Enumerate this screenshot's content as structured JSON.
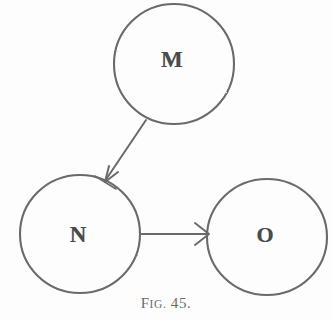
{
  "figure": {
    "caption_full": "FIG. 45.",
    "caption_prefix": "F",
    "caption_prefix_small": "IG.",
    "caption_number": "45.",
    "background_color": "#fdfdfd",
    "stroke_color": "#6a6a6a",
    "label_color": "#4b4b4b"
  },
  "diagram": {
    "type": "node-arrow-diagram",
    "nodes": [
      {
        "id": "M",
        "label": "M",
        "cx": 174,
        "cy": 64,
        "rx": 60,
        "ry": 60,
        "label_x": 172,
        "label_y": 59
      },
      {
        "id": "N",
        "label": "N",
        "cx": 80,
        "cy": 234,
        "rx": 60,
        "ry": 59,
        "label_x": 78,
        "label_y": 234
      },
      {
        "id": "O",
        "label": "O",
        "cx": 267,
        "cy": 237,
        "rx": 60,
        "ry": 58,
        "label_x": 265,
        "label_y": 235
      }
    ],
    "arrows": [
      {
        "id": "m-to-n",
        "from": "M",
        "to": "N",
        "x1": 146,
        "y1": 120,
        "x2": 104,
        "y2": 182,
        "direction": "down-left"
      },
      {
        "id": "n-to-o",
        "from": "N",
        "to": "O",
        "x1": 140,
        "y1": 234,
        "x2": 209,
        "y2": 234,
        "direction": "right"
      }
    ]
  }
}
